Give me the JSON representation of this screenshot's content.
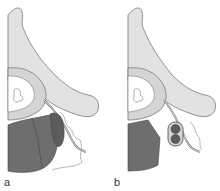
{
  "figure": {
    "panels": [
      {
        "label": "a",
        "description": "Spinal cross-section with large dark mass adjacent to vertebral body and nerve root"
      },
      {
        "label": "b",
        "description": "Spinal cross-section with small oval lesion containing two round nodules near nerve root"
      }
    ],
    "colors": {
      "bone": "#e2e2e2",
      "bone_outline": "#7a7a7a",
      "canal": "#ffffff",
      "disc": "#6e6e6e",
      "mass": "#5c5c5c",
      "tissue_line": "#888888"
    }
  }
}
